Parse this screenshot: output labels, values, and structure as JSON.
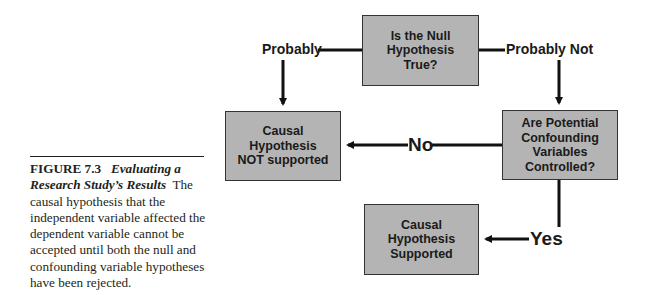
{
  "caption": {
    "figure_number": "FIGURE 7.3",
    "figure_title": "Evaluating a Research Study’s Results",
    "body": "The causal hypothesis that the independent variable affected the dependent variable cannot be accepted until both the null and confounding variable hypotheses have been rejected."
  },
  "diagram": {
    "nodes": {
      "null_question": "Is the Null Hypothesis True?",
      "not_supported": "Causal Hypothesis NOT supported",
      "confound_question": "Are Potential Confounding Variables Controlled?",
      "supported": "Causal Hypothesis Supported"
    },
    "edges": {
      "probably": "Probably",
      "probably_not": "Probably Not",
      "no": "No",
      "yes": "Yes"
    },
    "colors": {
      "box_fill": "#b4b4b4",
      "box_border": "#333333",
      "line": "#111111"
    }
  }
}
